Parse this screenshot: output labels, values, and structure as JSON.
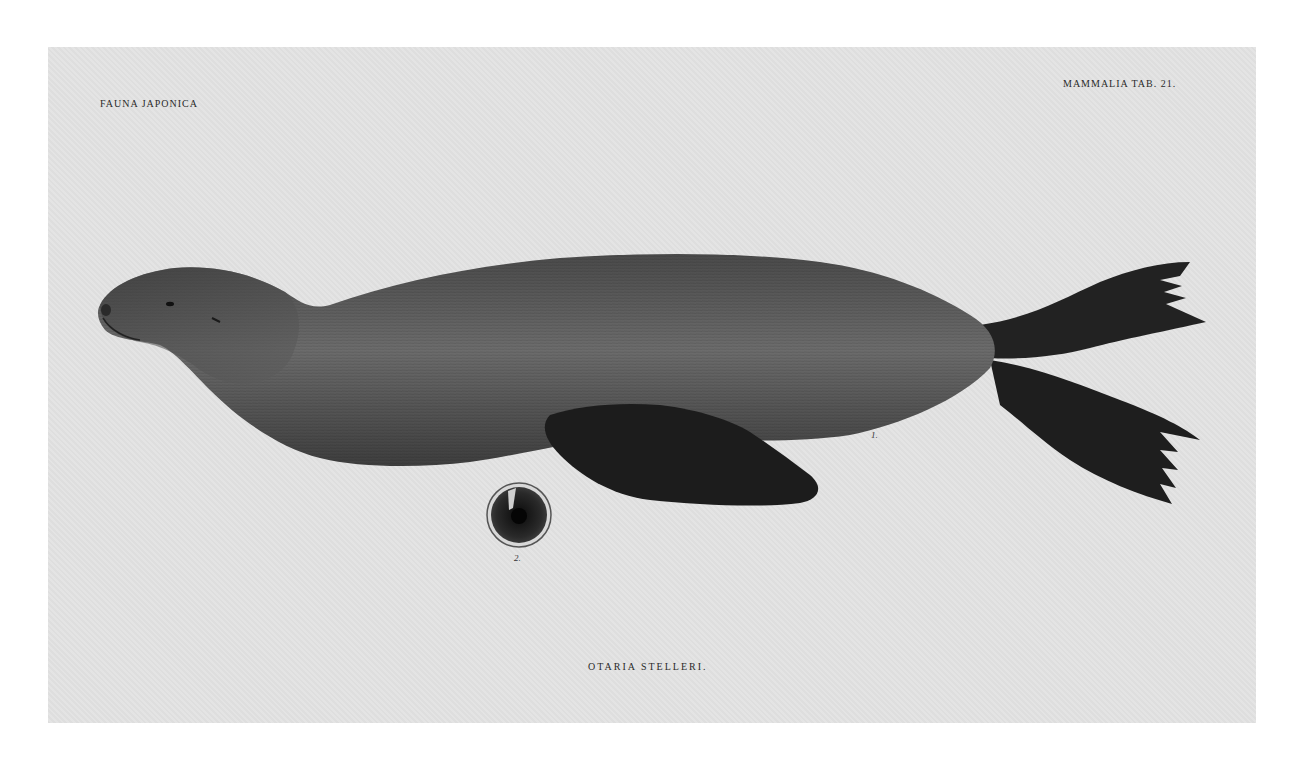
{
  "plate": {
    "header_left": "FAUNA JAPONICA",
    "header_right": "MAMMALIA  TAB. 21.",
    "caption": "OTARIA  STELLERI.",
    "figure_labels": {
      "fig1": "1.",
      "fig2": "2."
    },
    "subject": "steller-sea-lion-illustration",
    "colors": {
      "page": "#ffffff",
      "paper": "#e3e3e3",
      "body": "#5a5a5a",
      "flipper": "#1e1e1e",
      "text": "#2a2a2a"
    }
  }
}
